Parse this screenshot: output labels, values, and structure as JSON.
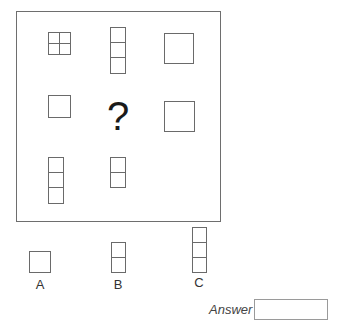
{
  "puzzle": {
    "missing_marker": "?",
    "grid": [
      [
        {
          "shape": "square-2x2-grid"
        },
        {
          "shape": "vertical-3-cells"
        },
        {
          "shape": "large-square"
        }
      ],
      [
        {
          "shape": "small-square"
        },
        {
          "shape": "missing"
        },
        {
          "shape": "large-square"
        }
      ],
      [
        {
          "shape": "vertical-3-cells"
        },
        {
          "shape": "vertical-2-cells"
        },
        {
          "shape": "empty"
        }
      ]
    ]
  },
  "options": [
    {
      "label": "A",
      "shape": "small-square"
    },
    {
      "label": "B",
      "shape": "vertical-2-cells"
    },
    {
      "label": "C",
      "shape": "vertical-3-cells"
    }
  ],
  "answer": {
    "label": "Answer",
    "value": ""
  }
}
